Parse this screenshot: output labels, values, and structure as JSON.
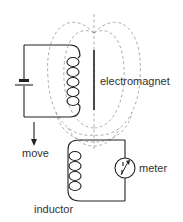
{
  "diagram": {
    "labels": {
      "electromagnet": "electromagnet",
      "move": "move",
      "meter": "meter",
      "inductor": "inductor"
    },
    "colors": {
      "wire": "#222222",
      "field_lines": "#9a9a9a",
      "text": "#333333",
      "background": "#ffffff"
    },
    "components": [
      {
        "name": "battery",
        "type": "cell"
      },
      {
        "name": "electromagnet-coil",
        "type": "coil",
        "turns": 5
      },
      {
        "name": "iron-core",
        "type": "bar"
      },
      {
        "name": "inductor-coil",
        "type": "coil",
        "turns": 5
      },
      {
        "name": "meter",
        "type": "galvanometer"
      },
      {
        "name": "move-arrow",
        "type": "arrow",
        "direction": "down"
      },
      {
        "name": "magnetic-field-lines",
        "type": "dashed-loops"
      }
    ]
  }
}
